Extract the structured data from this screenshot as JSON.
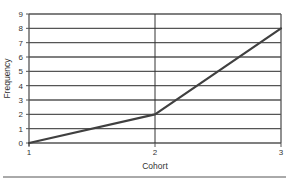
{
  "chart_data": {
    "type": "line",
    "title": "",
    "xlabel": "Cohort",
    "ylabel": "Frequency",
    "categories": [
      "1",
      "2",
      "3"
    ],
    "x": [
      1,
      2,
      3
    ],
    "series": [
      {
        "name": "Frequency",
        "values": [
          0,
          2,
          8
        ]
      }
    ],
    "xlim": [
      1,
      3
    ],
    "ylim": [
      0,
      9
    ],
    "y_ticks": [
      0,
      1,
      2,
      3,
      4,
      5,
      6,
      7,
      8,
      9
    ],
    "x_ticks": [
      1,
      2,
      3
    ],
    "grid": {
      "horizontal": true,
      "vertical_at": [
        2
      ]
    },
    "legend": "none"
  },
  "colors": {
    "line": "#404040",
    "grid": "#555555",
    "axis": "#555555",
    "text": "#333333",
    "background": "#ffffff"
  }
}
